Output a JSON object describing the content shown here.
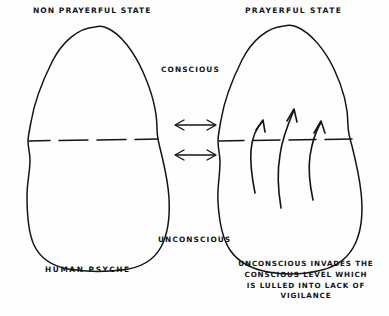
{
  "diagram": {
    "style": "hand-drawn ink sketch",
    "background_color": "#fefefe",
    "ink_color": "#141414",
    "titles": {
      "left": "NON PRAYERFUL STATE",
      "right": "PRAYERFUL STATE"
    },
    "labels": {
      "conscious": "CONSCIOUS",
      "unconscious": "UNCONSCIOUS",
      "human_psyche": "HUMAN PSYCHE"
    },
    "caption": {
      "line1": "UNCONSCIOUS INVADES THE",
      "line2": "CONSCIOUS LEVEL WHICH",
      "line3": "IS LULLED INTO LACK OF",
      "line4": "VIGILANCE"
    },
    "elements": {
      "left_blob": "rounded egg-shaped outline representing the human psyche in a non-prayerful state",
      "right_blob": "rounded egg-shaped outline representing the human psyche in a prayerful state",
      "divider_left": "horizontal dashed line splitting the left blob into conscious (upper) and unconscious (lower)",
      "divider_right": "horizontal dashed line splitting the right blob into conscious (upper) and unconscious (lower)",
      "arrows_between": "two horizontal double-headed arrows linking the two psyches",
      "arrows_up": "three curved upward arrows inside the right blob crossing the dashed line"
    },
    "counts": {
      "blobs": 2,
      "dashed_dividers": 2,
      "double_headed_arrows": 2,
      "upward_arrows": 3
    }
  }
}
